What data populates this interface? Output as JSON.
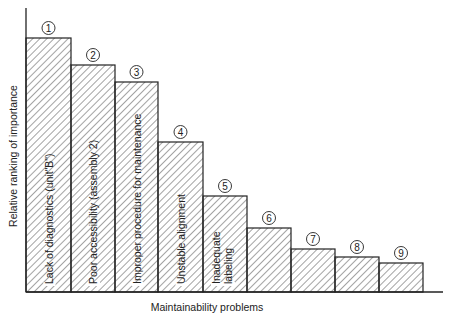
{
  "chart_data": {
    "type": "bar",
    "title": "",
    "xlabel": "Maintainability problems",
    "ylabel": "Relative ranking of importance",
    "grid": false,
    "legend": null,
    "ylim": [
      0,
      100
    ],
    "categories": [
      "Lack of diagnostics (unit\"B\")",
      "Poor accessibility (assembly 2)",
      "Improper procedure for maintenance",
      "Unstable alignment",
      "Inadequate labeling",
      "",
      "",
      "",
      ""
    ],
    "ranks": [
      "1",
      "2",
      "3",
      "4",
      "5",
      "6",
      "7",
      "8",
      "9"
    ],
    "values": [
      100,
      89,
      82,
      59,
      38,
      25,
      17,
      14,
      11
    ],
    "style": {
      "fill": "hatched diagonal",
      "stroke": "#222222"
    }
  },
  "layout": {
    "origin_x": 26,
    "baseline_y": 292,
    "axis_top_y": 8,
    "axis_right_x": 443,
    "bar_edges": [
      26,
      71,
      115,
      158,
      203,
      247,
      291,
      335,
      379,
      423
    ],
    "bar_tops": [
      38,
      65,
      82,
      142,
      196,
      228,
      249,
      257,
      263
    ]
  }
}
